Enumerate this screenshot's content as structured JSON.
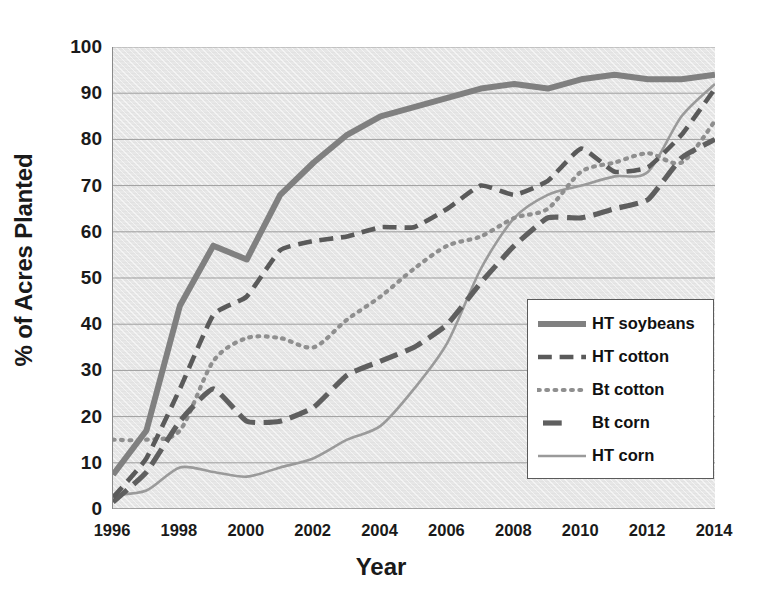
{
  "chart_data": {
    "type": "line",
    "title": "",
    "xlabel": "Year",
    "ylabel": "% of Acres Planted",
    "xlim": [
      1996,
      2014
    ],
    "ylim": [
      0,
      100
    ],
    "grid": true,
    "legend_position": "bottom-right",
    "x": [
      1996,
      1997,
      1998,
      1999,
      2000,
      2001,
      2002,
      2003,
      2004,
      2005,
      2006,
      2007,
      2008,
      2009,
      2010,
      2011,
      2012,
      2013,
      2014
    ],
    "y_ticks": [
      "0",
      "10",
      "20",
      "30",
      "40",
      "50",
      "60",
      "70",
      "80",
      "90",
      "100"
    ],
    "x_ticks": [
      "1996",
      "1998",
      "2000",
      "2002",
      "2004",
      "2006",
      "2008",
      "2010",
      "2012",
      "2014"
    ],
    "x_minor_step": 1,
    "series": [
      {
        "name": "HT soybeans",
        "style": "solid-thick",
        "color": "#808080",
        "width": 6,
        "values": [
          7.4,
          17,
          44,
          57,
          54,
          68,
          75,
          81,
          85,
          87,
          89,
          91,
          92,
          91,
          93,
          94,
          93,
          93,
          94
        ]
      },
      {
        "name": "HT cotton",
        "style": "dashed",
        "color": "#5a5a5a",
        "width": 4.6,
        "values": [
          2.5,
          11,
          26,
          42,
          46,
          56,
          58,
          59,
          61,
          61,
          65,
          70,
          68,
          71,
          78,
          73,
          74,
          81,
          91
        ]
      },
      {
        "name": "Bt cotton",
        "style": "dotted",
        "color": "#8f8f8f",
        "width": 4.2,
        "values": [
          15,
          15,
          17,
          32,
          37,
          37,
          35,
          41,
          46,
          52,
          57,
          59,
          63,
          65,
          73,
          75,
          77,
          75,
          84
        ]
      },
      {
        "name": "Bt corn",
        "style": "long-dash",
        "color": "#5f5f5f",
        "width": 5.2,
        "values": [
          1.5,
          8,
          19,
          26,
          19,
          19,
          22,
          29,
          32,
          35,
          40,
          49,
          57,
          63,
          63,
          65,
          67,
          76,
          80
        ]
      },
      {
        "name": "HT corn",
        "style": "solid-thin",
        "color": "#9a9a9a",
        "width": 2.6,
        "values": [
          3,
          4,
          9,
          8,
          7,
          9,
          11,
          15,
          18,
          26,
          36,
          52,
          63,
          68,
          70,
          72,
          73,
          85,
          92
        ]
      }
    ]
  },
  "axes": {
    "y_label": "% of Acres Planted",
    "x_label": "Year",
    "y_ticks": [
      "100",
      "90",
      "80",
      "70",
      "60",
      "50",
      "40",
      "30",
      "20",
      "10",
      "0"
    ],
    "x_ticks": [
      "1996",
      "1998",
      "2000",
      "2002",
      "2004",
      "2006",
      "2008",
      "2010",
      "2012",
      "2014"
    ]
  },
  "legend": {
    "items": [
      {
        "label": "HT soybeans"
      },
      {
        "label": "HT cotton"
      },
      {
        "label": "Bt cotton"
      },
      {
        "label": "Bt corn"
      },
      {
        "label": "HT corn"
      }
    ]
  }
}
